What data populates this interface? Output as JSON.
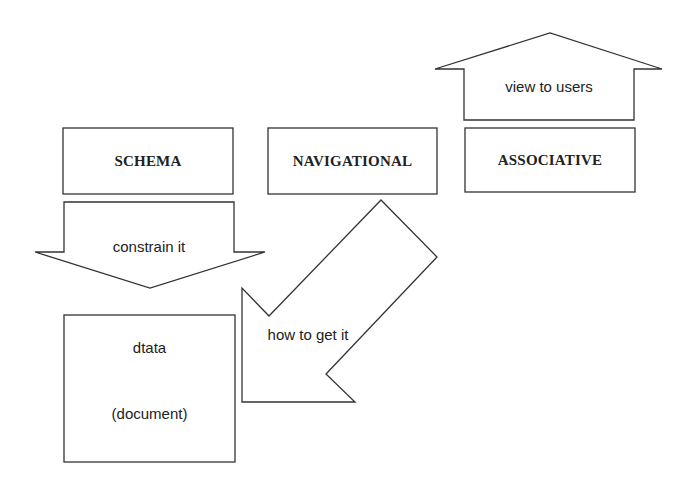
{
  "diagram": {
    "boxes": [
      {
        "id": "schema",
        "label": "SCHEMA"
      },
      {
        "id": "navigational",
        "label": "NAVIGATIONAL"
      },
      {
        "id": "associative",
        "label": "ASSOCIATIVE"
      },
      {
        "id": "data",
        "label_line1": "dtata",
        "label_line2": "(document)"
      }
    ],
    "arrows": [
      {
        "id": "view-to-users",
        "label": "view to users",
        "direction": "up",
        "from": "associative"
      },
      {
        "id": "constrain-it",
        "label": "constrain it",
        "direction": "down",
        "from": "schema",
        "to": "data"
      },
      {
        "id": "how-to-get-it",
        "label": "how to get it",
        "direction": "down-left",
        "from": "navigational",
        "to": "data"
      }
    ]
  },
  "colors": {
    "stroke": "#333333",
    "fill": "#ffffff",
    "text": "#222222"
  }
}
